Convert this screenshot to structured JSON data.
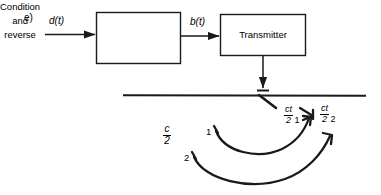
{
  "figure": {
    "part_label": "e)",
    "background_color": "#ffffff",
    "line_color": "#1a1a1a",
    "width": 381,
    "height": 195
  },
  "signals": {
    "input": "d(t)",
    "intermediate": "b(t)"
  },
  "blocks": [
    {
      "id": "condition-and-reverse",
      "lines": [
        "Condition",
        "and",
        "reverse"
      ]
    },
    {
      "id": "transmitter",
      "lines": [
        "Transmitter"
      ]
    }
  ],
  "annotations": {
    "half_c": {
      "numerator": "c",
      "denominator": "2",
      "index": ""
    },
    "range_1": {
      "numerator": "ct",
      "denominator": "2",
      "index": "1"
    },
    "range_2": {
      "numerator": "ct",
      "denominator": "2",
      "index": "2"
    },
    "path_labels": [
      "1",
      "2"
    ]
  },
  "interface": {
    "label": "",
    "description": ""
  }
}
